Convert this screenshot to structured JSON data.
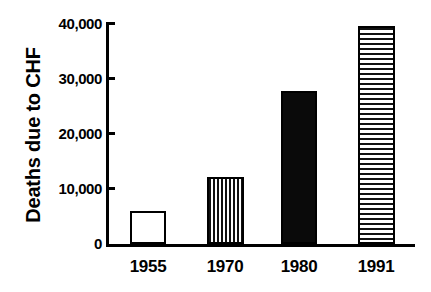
{
  "chart_data": {
    "type": "bar",
    "title": "",
    "subtitle": "",
    "xlabel": "",
    "ylabel": "Deaths due to CHF",
    "categories": [
      "1955",
      "1970",
      "1980",
      "1991"
    ],
    "values": [
      6000,
      12000,
      27500,
      39300
    ],
    "series": [
      {
        "name": "Deaths due to CHF",
        "values": [
          6000,
          12000,
          27500,
          39300
        ]
      }
    ],
    "bar_fills": [
      "open",
      "vertical-stripes",
      "solid-black",
      "horizontal-stripes"
    ],
    "ylim": [
      0,
      40000
    ],
    "yticks": [
      0,
      10000,
      20000,
      30000,
      40000
    ],
    "ytick_labels": [
      "0",
      "10,000",
      "20,000",
      "30,000",
      "40,000"
    ],
    "xtick_labels": [
      "1955",
      "1970",
      "1980",
      "1991"
    ],
    "grid": false,
    "legend": false,
    "legend_position": "none",
    "colors": {
      "axis": "#000000",
      "bar_outline": "#000000",
      "bar_solid": "#0a0a0a",
      "bar_open": "#ffffff",
      "background": "#ffffff"
    }
  }
}
